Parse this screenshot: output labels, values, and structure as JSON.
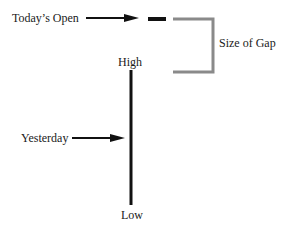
{
  "labels": {
    "todays_open": "Today’s Open",
    "size_of_gap": "Size of Gap",
    "high": "High",
    "yesterday": "Yesterday",
    "low": "Low"
  },
  "colors": {
    "line": "#111111",
    "bracket": "#8a8a8a",
    "text": "#1a1a1a"
  }
}
